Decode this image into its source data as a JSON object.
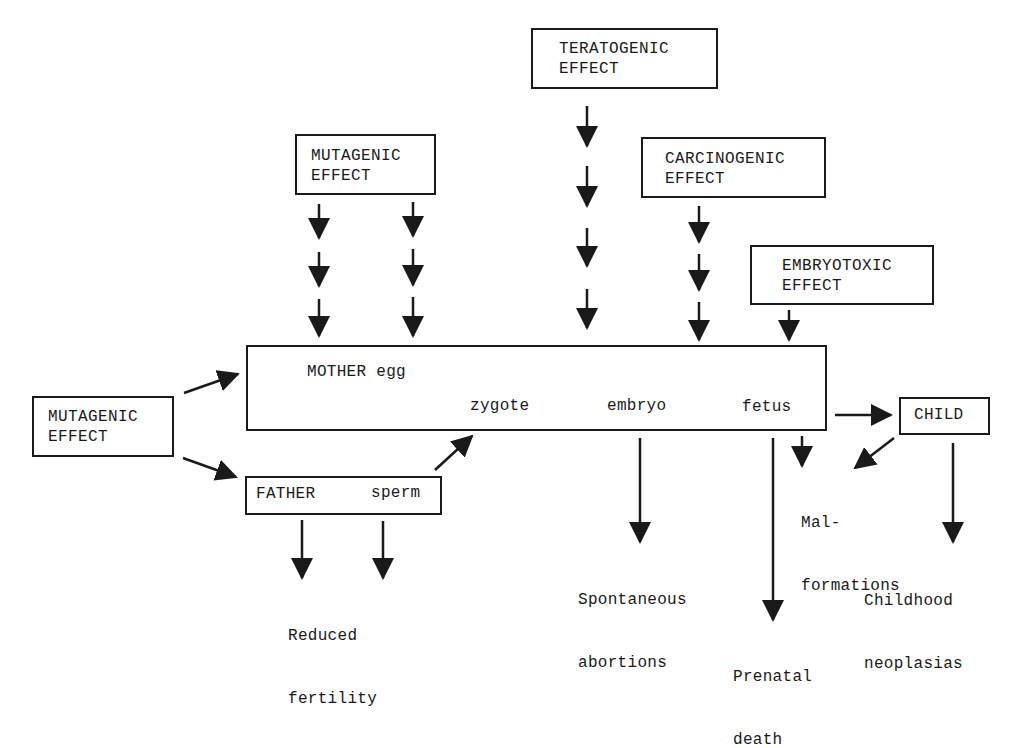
{
  "diagram": {
    "effects": {
      "teratogenic": {
        "line1": "TERATOGENIC",
        "line2": "EFFECT"
      },
      "mutagenic_top": {
        "line1": "MUTAGENIC",
        "line2": "EFFECT"
      },
      "carcinogenic": {
        "line1": "CARCINOGENIC",
        "line2": "EFFECT"
      },
      "embryotoxic": {
        "line1": "EMBRYOTOXIC",
        "line2": "EFFECT"
      },
      "mutagenic_left": {
        "line1": "MUTAGENIC",
        "line2": "EFFECT"
      }
    },
    "mother_box": {
      "mother": "MOTHER egg",
      "zygote": "zygote",
      "embryo": "embryo",
      "fetus": "fetus"
    },
    "father_box": {
      "father": "FATHER",
      "sperm": "sperm"
    },
    "child": "CHILD",
    "outcomes": {
      "reduced_fertility": {
        "line1": "Reduced",
        "line2": "fertility"
      },
      "spontaneous_abortions": {
        "line1": "Spontaneous",
        "line2": "abortions"
      },
      "prenatal_death": {
        "line1": "Prenatal",
        "line2": "death"
      },
      "malformations": {
        "line1": "Mal-",
        "line2": "formations"
      },
      "childhood_neoplasias": {
        "line1": "Childhood",
        "line2": "neoplasias"
      }
    },
    "colors": {
      "ink": "#1a1a1a",
      "background": "#ffffff"
    }
  }
}
